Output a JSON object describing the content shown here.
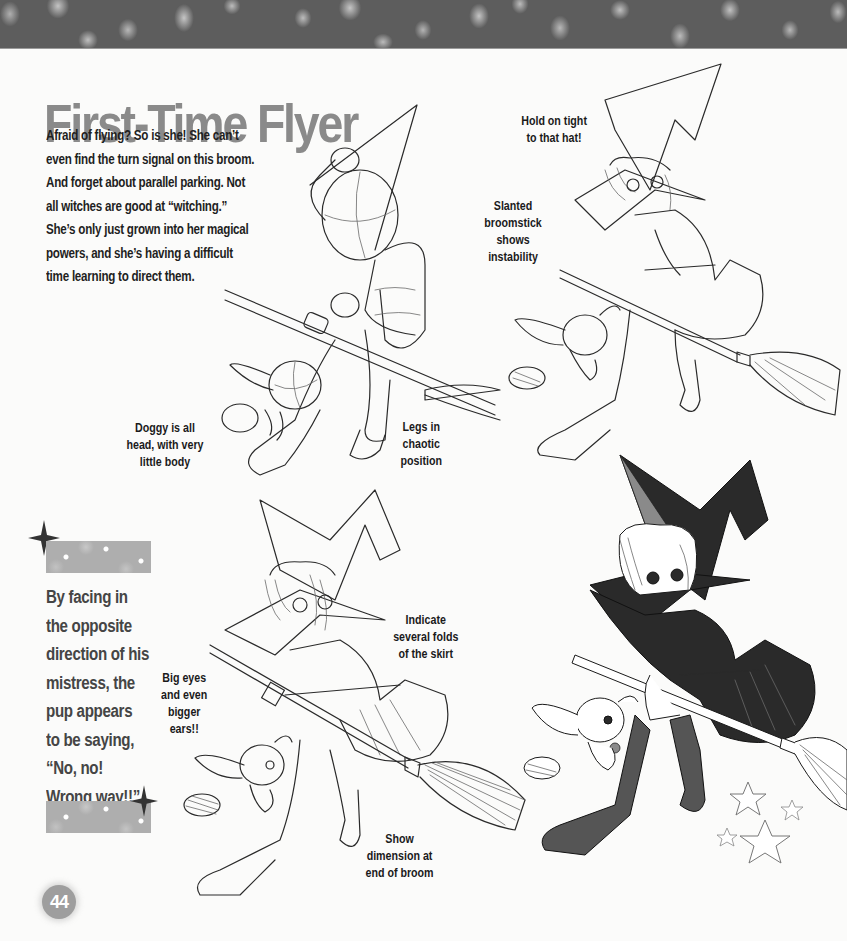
{
  "header": {
    "title": "First-Time Flyer"
  },
  "intro": {
    "lines": [
      "Afraid of flying? So is she! She can’t",
      "even find the turn signal on this broom.",
      "And forget about parallel parking. Not",
      "all witches are good at “witching.”",
      "She’s only just grown into her magical",
      "powers, and she’s having a difficult",
      "time learning to direct them."
    ]
  },
  "annotations": {
    "hold_hat": [
      "Hold on tight",
      "to that hat!"
    ],
    "slanted_broomstick": [
      "Slanted",
      "broomstick",
      "shows",
      "instability"
    ],
    "doggy_head": [
      "Doggy is all",
      "head, with very",
      "little body"
    ],
    "legs_chaotic": [
      "Legs in",
      "chaotic",
      "position"
    ],
    "skirt_folds": [
      "Indicate",
      "several folds",
      "of the skirt"
    ],
    "big_eyes": [
      "Big eyes",
      "and even",
      "bigger",
      "ears!!"
    ],
    "broom_dimension": [
      "Show",
      "dimension at",
      "end of broom"
    ]
  },
  "sidebar": {
    "lines": [
      "By facing in",
      "the opposite",
      "direction of his",
      "mistress, the",
      "pup appears",
      "to be saying,",
      "“No, no!",
      "Wrong way!!”"
    ]
  },
  "illustrations": {
    "step1": "sketch-skeleton-witch-on-broom",
    "step2": "sketch-outline-witch-on-broom",
    "step3": "sketch-detailed-witch-on-broom",
    "step4": "finished-inked-witch-on-broom"
  },
  "colors": {
    "title": "#8a8a8a",
    "body_text": "#1f1f1f",
    "sidebar_text": "#454545",
    "band": "#5d5d5d",
    "page_badge": "#9e9e9e"
  },
  "footer": {
    "page_number": "44"
  }
}
